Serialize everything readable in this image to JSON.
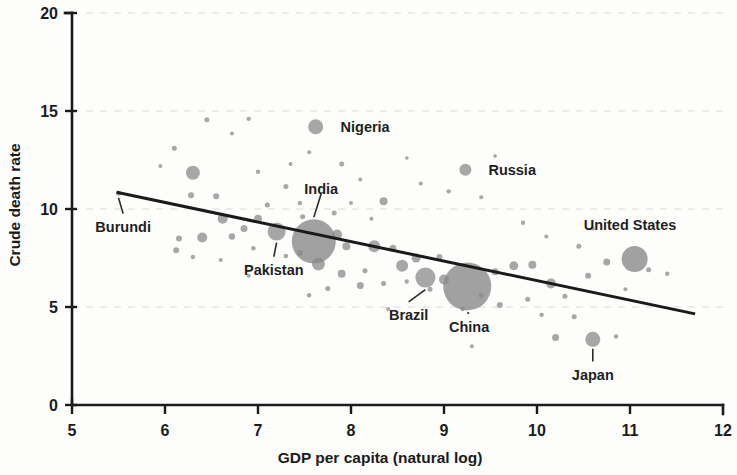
{
  "chart_data": {
    "type": "scatter",
    "title": "",
    "xlabel": "GDP per capita (natural log)",
    "ylabel": "Crude death rate",
    "xlim": [
      5,
      12
    ],
    "ylim": [
      0,
      20
    ],
    "xticks": [
      5,
      6,
      7,
      8,
      9,
      10,
      11,
      12
    ],
    "xtick_labels": [
      "5",
      "6",
      "7",
      "8",
      "9",
      "10",
      "11",
      "12"
    ],
    "yticks": [
      0,
      5,
      10,
      15,
      20
    ],
    "ytick_labels": [
      "0",
      "5",
      "10",
      "15",
      "20"
    ],
    "grid": "horizontal-dashed-faint",
    "legend": "none",
    "bubble_size_encodes": "population",
    "trendline": {
      "type": "linear",
      "x_start": 5.48,
      "y_start": 10.85,
      "x_end": 11.7,
      "y_end": 4.65
    },
    "labeled_points": [
      {
        "name": "Burundi",
        "x": 5.5,
        "y": 10.8,
        "r": 2.5,
        "label_x": 5.55,
        "label_y": 9.1,
        "label_anchor": "middle",
        "leader": true
      },
      {
        "name": "Nigeria",
        "x": 7.62,
        "y": 14.2,
        "r": 7.5,
        "label_x": 7.78,
        "label_y": 14.2,
        "label_anchor": "start",
        "leader": false
      },
      {
        "name": "Russia",
        "x": 9.23,
        "y": 12.0,
        "r": 6.0,
        "label_x": 9.37,
        "label_y": 12.0,
        "label_anchor": "start",
        "leader": false
      },
      {
        "name": "India",
        "x": 7.6,
        "y": 8.35,
        "r": 22.0,
        "label_x": 7.68,
        "label_y": 11.0,
        "label_anchor": "middle",
        "leader": true
      },
      {
        "name": "Pakistan",
        "x": 7.2,
        "y": 8.85,
        "r": 9.0,
        "label_x": 7.17,
        "label_y": 6.9,
        "label_anchor": "middle",
        "leader": true
      },
      {
        "name": "Brazil",
        "x": 8.8,
        "y": 6.5,
        "r": 10.0,
        "label_x": 8.62,
        "label_y": 4.6,
        "label_anchor": "middle",
        "leader": true
      },
      {
        "name": "China",
        "x": 9.25,
        "y": 6.05,
        "r": 24.0,
        "label_x": 9.27,
        "label_y": 4.0,
        "label_anchor": "middle",
        "leader": true
      },
      {
        "name": "Japan",
        "x": 10.6,
        "y": 3.35,
        "r": 7.5,
        "label_x": 10.6,
        "label_y": 1.55,
        "label_anchor": "middle",
        "leader": true
      },
      {
        "name": "United States",
        "x": 11.05,
        "y": 7.45,
        "r": 13.0,
        "label_x": 11.0,
        "label_y": 9.2,
        "label_anchor": "middle",
        "leader": false
      }
    ],
    "unlabeled_points": [
      {
        "x": 6.3,
        "y": 11.85,
        "r": 7.0
      },
      {
        "x": 6.28,
        "y": 10.7,
        "r": 3.0
      },
      {
        "x": 6.55,
        "y": 10.65,
        "r": 3.0
      },
      {
        "x": 6.1,
        "y": 13.1,
        "r": 2.5
      },
      {
        "x": 6.45,
        "y": 14.55,
        "r": 2.5
      },
      {
        "x": 6.9,
        "y": 14.6,
        "r": 2.2
      },
      {
        "x": 6.72,
        "y": 13.85,
        "r": 2.0
      },
      {
        "x": 5.95,
        "y": 12.2,
        "r": 2.0
      },
      {
        "x": 6.62,
        "y": 9.5,
        "r": 5.0
      },
      {
        "x": 6.85,
        "y": 9.0,
        "r": 3.5
      },
      {
        "x": 6.72,
        "y": 8.6,
        "r": 3.2
      },
      {
        "x": 6.4,
        "y": 8.55,
        "r": 5.0
      },
      {
        "x": 6.15,
        "y": 8.5,
        "r": 3.0
      },
      {
        "x": 6.12,
        "y": 7.9,
        "r": 3.0
      },
      {
        "x": 6.3,
        "y": 7.55,
        "r": 2.2
      },
      {
        "x": 6.6,
        "y": 7.4,
        "r": 2.0
      },
      {
        "x": 6.95,
        "y": 8.0,
        "r": 2.2
      },
      {
        "x": 7.0,
        "y": 9.5,
        "r": 4.0
      },
      {
        "x": 7.1,
        "y": 10.2,
        "r": 2.5
      },
      {
        "x": 7.45,
        "y": 10.3,
        "r": 2.2
      },
      {
        "x": 7.3,
        "y": 11.15,
        "r": 2.5
      },
      {
        "x": 7.0,
        "y": 11.9,
        "r": 2.2
      },
      {
        "x": 7.35,
        "y": 12.3,
        "r": 2.0
      },
      {
        "x": 7.9,
        "y": 12.3,
        "r": 2.5
      },
      {
        "x": 8.1,
        "y": 11.5,
        "r": 2.0
      },
      {
        "x": 7.55,
        "y": 12.9,
        "r": 2.0
      },
      {
        "x": 8.35,
        "y": 10.4,
        "r": 4.0
      },
      {
        "x": 8.0,
        "y": 10.3,
        "r": 2.0
      },
      {
        "x": 7.82,
        "y": 9.8,
        "r": 2.5
      },
      {
        "x": 8.22,
        "y": 9.5,
        "r": 2.0
      },
      {
        "x": 7.48,
        "y": 9.6,
        "r": 2.5
      },
      {
        "x": 7.85,
        "y": 8.7,
        "r": 5.0
      },
      {
        "x": 7.95,
        "y": 8.1,
        "r": 4.0
      },
      {
        "x": 8.25,
        "y": 8.1,
        "r": 6.0
      },
      {
        "x": 8.45,
        "y": 8.0,
        "r": 3.5
      },
      {
        "x": 7.65,
        "y": 7.2,
        "r": 6.5
      },
      {
        "x": 7.45,
        "y": 7.75,
        "r": 3.0
      },
      {
        "x": 7.3,
        "y": 7.6,
        "r": 2.2
      },
      {
        "x": 7.9,
        "y": 6.7,
        "r": 4.0
      },
      {
        "x": 8.15,
        "y": 6.85,
        "r": 2.5
      },
      {
        "x": 8.1,
        "y": 6.1,
        "r": 3.5
      },
      {
        "x": 8.35,
        "y": 6.2,
        "r": 2.5
      },
      {
        "x": 8.55,
        "y": 7.1,
        "r": 6.0
      },
      {
        "x": 8.7,
        "y": 7.5,
        "r": 4.5
      },
      {
        "x": 8.95,
        "y": 7.55,
        "r": 3.0
      },
      {
        "x": 8.6,
        "y": 6.3,
        "r": 2.2
      },
      {
        "x": 8.85,
        "y": 5.9,
        "r": 2.5
      },
      {
        "x": 9.0,
        "y": 6.4,
        "r": 5.0
      },
      {
        "x": 9.55,
        "y": 6.8,
        "r": 3.5
      },
      {
        "x": 9.75,
        "y": 7.1,
        "r": 4.5
      },
      {
        "x": 9.95,
        "y": 7.15,
        "r": 4.0
      },
      {
        "x": 9.4,
        "y": 5.6,
        "r": 2.5
      },
      {
        "x": 9.6,
        "y": 5.1,
        "r": 3.0
      },
      {
        "x": 9.2,
        "y": 4.9,
        "r": 2.2
      },
      {
        "x": 9.9,
        "y": 5.4,
        "r": 2.5
      },
      {
        "x": 10.15,
        "y": 6.2,
        "r": 5.0
      },
      {
        "x": 10.3,
        "y": 5.55,
        "r": 2.5
      },
      {
        "x": 10.05,
        "y": 4.6,
        "r": 2.2
      },
      {
        "x": 10.4,
        "y": 4.5,
        "r": 2.5
      },
      {
        "x": 10.2,
        "y": 3.45,
        "r": 3.5
      },
      {
        "x": 10.85,
        "y": 3.5,
        "r": 2.2
      },
      {
        "x": 10.55,
        "y": 6.6,
        "r": 3.0
      },
      {
        "x": 10.75,
        "y": 7.3,
        "r": 3.5
      },
      {
        "x": 11.2,
        "y": 6.9,
        "r": 2.5
      },
      {
        "x": 11.4,
        "y": 6.7,
        "r": 2.2
      },
      {
        "x": 10.45,
        "y": 8.1,
        "r": 2.5
      },
      {
        "x": 10.6,
        "y": 9.0,
        "r": 2.0
      },
      {
        "x": 9.85,
        "y": 9.3,
        "r": 2.2
      },
      {
        "x": 9.4,
        "y": 10.6,
        "r": 2.0
      },
      {
        "x": 9.05,
        "y": 10.9,
        "r": 2.2
      },
      {
        "x": 8.75,
        "y": 11.3,
        "r": 2.0
      },
      {
        "x": 9.55,
        "y": 12.7,
        "r": 1.8
      },
      {
        "x": 8.6,
        "y": 12.6,
        "r": 1.8
      },
      {
        "x": 10.1,
        "y": 8.6,
        "r": 2.0
      },
      {
        "x": 10.95,
        "y": 5.9,
        "r": 2.0
      },
      {
        "x": 9.3,
        "y": 3.0,
        "r": 2.0
      },
      {
        "x": 8.4,
        "y": 4.9,
        "r": 2.0
      },
      {
        "x": 7.55,
        "y": 5.6,
        "r": 2.2
      },
      {
        "x": 7.75,
        "y": 5.95,
        "r": 2.5
      },
      {
        "x": 6.9,
        "y": 6.6,
        "r": 2.0
      }
    ]
  },
  "axes": {
    "x_title": "GDP per capita (natural log)",
    "y_title": "Crude death rate"
  }
}
